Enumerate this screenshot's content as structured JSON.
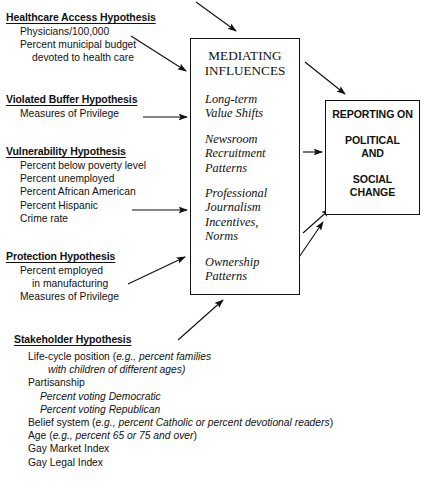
{
  "figure": {
    "type": "conceptual-flow-diagram"
  },
  "hypotheses": [
    {
      "id": "healthcare-access",
      "title": "Healthcare Access Hypothesis",
      "items": [
        {
          "text": "Physicians/100,000",
          "indent": 1,
          "italic": false
        },
        {
          "text": "Percent municipal budget",
          "indent": 1,
          "italic": false
        },
        {
          "text": "devoted to health care",
          "indent": 2,
          "italic": false
        }
      ]
    },
    {
      "id": "violated-buffer",
      "title": "Violated Buffer Hypothesis",
      "items": [
        {
          "text": "Measures of Privilege",
          "indent": 1,
          "italic": false
        }
      ]
    },
    {
      "id": "vulnerability",
      "title": "Vulnerability Hypothesis",
      "items": [
        {
          "text": "Percent below poverty level",
          "indent": 1,
          "italic": false
        },
        {
          "text": "Percent unemployed",
          "indent": 1,
          "italic": false
        },
        {
          "text": "Percent African American",
          "indent": 1,
          "italic": false
        },
        {
          "text": "Percent Hispanic",
          "indent": 1,
          "italic": false
        },
        {
          "text": "Crime rate",
          "indent": 1,
          "italic": false
        }
      ]
    },
    {
      "id": "protection",
      "title": "Protection Hypothesis",
      "items": [
        {
          "text": "Percent employed",
          "indent": 1,
          "italic": false
        },
        {
          "text": "in manufacturing",
          "indent": 2,
          "italic": false
        },
        {
          "text": "Measures of Privilege",
          "indent": 1,
          "italic": false
        }
      ]
    },
    {
      "id": "stakeholder",
      "title": "Stakeholder Hypothesis",
      "items": [
        {
          "text": "Life-cycle position (e.g., percent families",
          "indent": 1,
          "italic": false
        },
        {
          "text": "with children of different ages)",
          "indent": 3,
          "italic": true
        },
        {
          "text": "Partisanship",
          "indent": 1,
          "italic": false
        },
        {
          "text": "Percent voting Democratic",
          "indent": 2,
          "italic": true
        },
        {
          "text": "Percent voting Republican",
          "indent": 2,
          "italic": true
        },
        {
          "text": "Belief system (e.g., percent Catholic or percent devotional readers)",
          "indent": 1,
          "italic": false
        },
        {
          "text": "Age (e.g., percent 65 or 75 and over)",
          "indent": 1,
          "italic": false
        },
        {
          "text": "Gay Market Index",
          "indent": 1,
          "italic": false
        },
        {
          "text": "Gay Legal Index",
          "indent": 1,
          "italic": false
        }
      ]
    }
  ],
  "mediating_box": {
    "title_line_1": "MEDIATING",
    "title_line_2": "INFLUENCES",
    "groups": [
      {
        "lines": [
          "Long-term",
          "Value Shifts"
        ]
      },
      {
        "lines": [
          "Newsroom",
          "Recruitment",
          "Patterns"
        ]
      },
      {
        "lines": [
          "Professional",
          "Journalism",
          "Incentives,",
          "Norms"
        ]
      },
      {
        "lines": [
          "Ownership",
          "Patterns"
        ]
      }
    ]
  },
  "reporting_box": {
    "line_1": "REPORTING ON",
    "line_2": "POLITICAL",
    "line_3": "AND",
    "line_4": "SOCIAL",
    "line_5": "CHANGE"
  },
  "arrows": [
    {
      "name": "arrow-top-into-mediating",
      "from": [
        196,
        2
      ],
      "to": [
        238,
        33
      ]
    },
    {
      "name": "arrow-healthcare-to-mediating",
      "from": [
        131,
        36
      ],
      "to": [
        188,
        73
      ]
    },
    {
      "name": "arrow-violated-buffer-to-mediating",
      "from": [
        143,
        117
      ],
      "to": [
        188,
        117
      ]
    },
    {
      "name": "arrow-vulnerability-to-mediating",
      "from": [
        132,
        210
      ],
      "to": [
        188,
        210
      ]
    },
    {
      "name": "arrow-protection-to-mediating",
      "from": [
        128,
        284
      ],
      "to": [
        186,
        257
      ]
    },
    {
      "name": "arrow-stakeholder-to-mediating",
      "from": [
        178,
        340
      ],
      "to": [
        223,
        301
      ]
    },
    {
      "name": "arrow-mediating-to-reporting",
      "from": [
        305,
        105
      ],
      "to": [
        345,
        94
      ]
    },
    {
      "name": "arrow-mediating-side-to-reporting",
      "from": [
        303,
        152
      ],
      "to": [
        322,
        152
      ]
    },
    {
      "name": "arrow-lower-left-to-reporting-a",
      "from": [
        303,
        233
      ],
      "to": [
        330,
        208
      ]
    },
    {
      "name": "arrow-lower-left-to-reporting-b",
      "from": [
        278,
        288
      ],
      "to": [
        322,
        222
      ]
    }
  ],
  "colors": {
    "ink": "#111111",
    "background": "#ffffff"
  }
}
